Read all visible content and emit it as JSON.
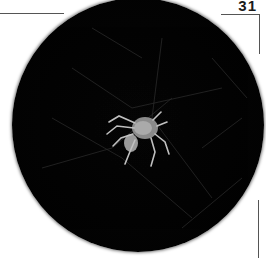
{
  "page": {
    "number": "31"
  },
  "photo": {
    "subject": "spider on web",
    "shape": "circle",
    "background_color": "#000000",
    "subject_color": "#b8b8b8"
  },
  "icons": {
    "spider": "spider-icon"
  }
}
